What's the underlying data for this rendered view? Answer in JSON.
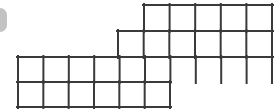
{
  "figure": {
    "total_cells": 27,
    "cell_width": 25.6,
    "cell_height": 25.5,
    "colors": {
      "line": "#3a3a3a",
      "cell_fill": "#ffffff",
      "background": "#ffffff",
      "edge_artifact": "#b9b9b9"
    },
    "line_width": 2,
    "rows": [
      {
        "name": "row-1-top",
        "index": 0,
        "cell_count": 5,
        "x_start": 144,
        "x_end": 272,
        "y_top": 5,
        "y_bottom": 31
      },
      {
        "name": "row-2",
        "index": 1,
        "cell_count": 6,
        "x_start": 118,
        "x_end": 272,
        "y_top": 31,
        "y_bottom": 57
      },
      {
        "name": "row-3",
        "index": 2,
        "cell_count": 10,
        "x_start": 18,
        "x_end": 272,
        "y_top": 57,
        "y_bottom": 82
      },
      {
        "name": "row-4-bottom",
        "index": 3,
        "cell_count": 6,
        "x_start": 18,
        "x_end": 170,
        "y_top": 82,
        "y_bottom": 107
      }
    ]
  },
  "edge_artifact": {
    "name": "clipped-rounded-shape",
    "visible": true
  }
}
